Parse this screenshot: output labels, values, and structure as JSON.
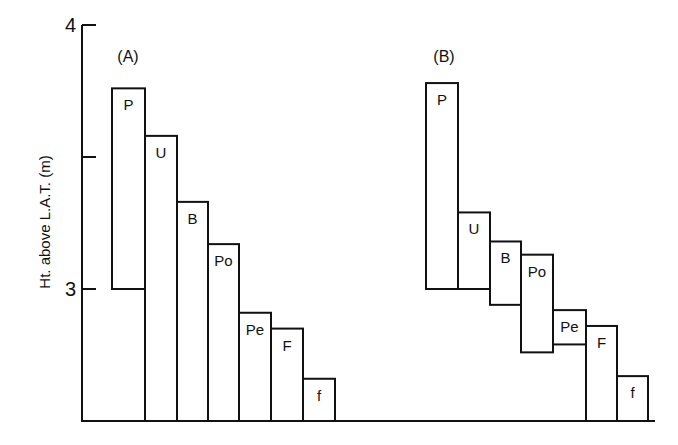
{
  "chart_data": {
    "type": "bar",
    "subtype": "floating-range",
    "ylabel": "Ht. above L.A.T. (m)",
    "yticks": [
      {
        "value": 4,
        "label": "4"
      },
      {
        "value": 3.5,
        "label": ""
      },
      {
        "value": 3,
        "label": "3"
      }
    ],
    "ylim": [
      2.5,
      4.0
    ],
    "grid": false,
    "panels": [
      {
        "label": "(A)",
        "bars": [
          {
            "name": "P",
            "top": 3.76,
            "bottom": 3.0
          },
          {
            "name": "U",
            "top": 3.58,
            "bottom": 2.5
          },
          {
            "name": "B",
            "top": 3.33,
            "bottom": 2.5
          },
          {
            "name": "Po",
            "top": 3.17,
            "bottom": 2.5
          },
          {
            "name": "Pe",
            "top": 2.91,
            "bottom": 2.5
          },
          {
            "name": "F",
            "top": 2.85,
            "bottom": 2.5
          },
          {
            "name": "f",
            "top": 2.66,
            "bottom": 2.5
          }
        ]
      },
      {
        "label": "(B)",
        "bars": [
          {
            "name": "P",
            "top": 3.78,
            "bottom": 3.0
          },
          {
            "name": "U",
            "top": 3.29,
            "bottom": 3.0
          },
          {
            "name": "B",
            "top": 3.18,
            "bottom": 2.94
          },
          {
            "name": "Po",
            "top": 3.13,
            "bottom": 2.76
          },
          {
            "name": "Pe",
            "top": 2.92,
            "bottom": 2.79
          },
          {
            "name": "F",
            "top": 2.86,
            "bottom": 2.5
          },
          {
            "name": "f",
            "top": 2.67,
            "bottom": 2.5
          }
        ]
      }
    ]
  },
  "layout": {
    "panel_x": [
      [
        112,
        145,
        177,
        208,
        239,
        271,
        303,
        335
      ],
      [
        426,
        458,
        490,
        521,
        553,
        586,
        617,
        648
      ]
    ],
    "panel_label_x": [
      128,
      444
    ],
    "y_of_4": 25,
    "px_per_m": 264,
    "axis_x": 82,
    "baseline_end_x": 655
  }
}
